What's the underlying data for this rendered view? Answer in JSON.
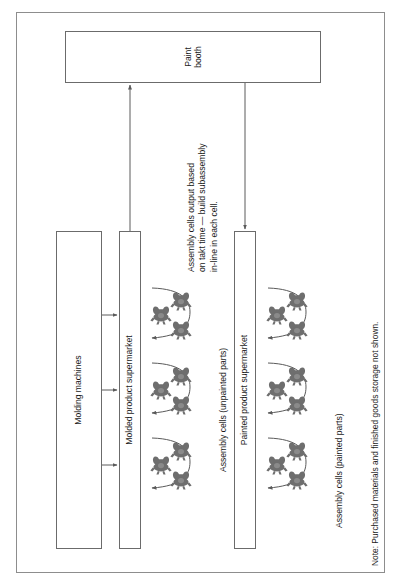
{
  "diagram": {
    "frame": {
      "name": "plant-boundary"
    },
    "paint_booth": {
      "label": "Paint\nbooth"
    },
    "molding_machines": {
      "label": "Molding machines"
    },
    "molded_supermarket": {
      "label": "Molded product supermarket"
    },
    "painted_supermarket": {
      "label": "Painted product supermarket"
    },
    "assembly_unpainted": {
      "label": "Assembly cells (unpainted parts)"
    },
    "assembly_painted": {
      "label": "Assembly cells (painted parts)"
    },
    "takt_note": "Assembly cells output based\non takt time — build subassembly\nin-line in each cell.",
    "footer_note": "Note: Purchased materials and finished goods storage not shown.",
    "colors": {
      "frame_stroke": "#8d8d8d",
      "box_stroke": "#6b6b6b",
      "flow_stroke": "#5a5a5a",
      "operator_fill": "#6e6e6e",
      "text": "#1a1a1a",
      "background": "#ffffff"
    },
    "counts": {
      "molding_to_supermarket_arrows": 3,
      "unpainted_cells": 3,
      "painted_cells": 3,
      "operators_per_cell": 3
    }
  }
}
